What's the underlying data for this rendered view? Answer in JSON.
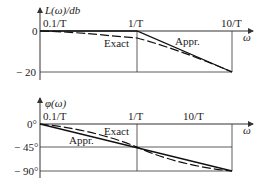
{
  "magnitude_plot": {
    "y_label": "L(ω)/db",
    "x_label": "ω",
    "x_ticks": [
      "0.1/T",
      "1/T",
      "10/T"
    ],
    "y_ticks": [
      "0",
      "− 20"
    ],
    "curves": {
      "exact_label": "Exact",
      "appr_label": "Appr."
    }
  },
  "phase_plot": {
    "y_label": "φ(ω)",
    "x_label": "ω",
    "x_ticks": [
      "0.1/T",
      "1/T",
      "10/T"
    ],
    "y_ticks": [
      "0°",
      "− 45°",
      "− 90°"
    ],
    "curves": {
      "exact_label": "Exact",
      "appr_label": "Appr."
    }
  }
}
